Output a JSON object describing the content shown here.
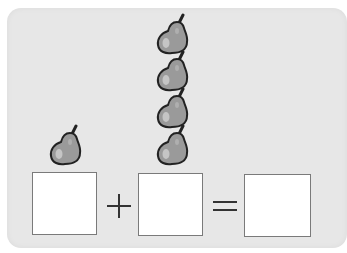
{
  "worksheet": {
    "task": "pear addition counting",
    "groups": [
      {
        "name": "left-group",
        "count": 1,
        "item": "pear-icon"
      },
      {
        "name": "right-group",
        "count": 4,
        "item": "pear-icon"
      }
    ],
    "equation": {
      "operator": "+",
      "equals": "=",
      "box_1_value": "",
      "box_2_value": "",
      "box_3_value": ""
    },
    "colors": {
      "card": "#e7e7e7",
      "pear_fill": "#9a9a9a",
      "pear_outline": "#222222",
      "box_fill": "#ffffff"
    }
  }
}
